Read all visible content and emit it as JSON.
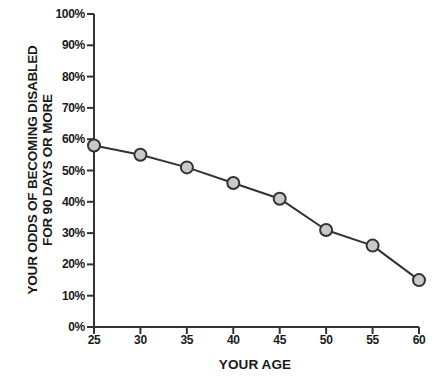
{
  "chart_data": {
    "type": "line",
    "title": "",
    "xlabel": "YOUR AGE",
    "ylabel": "YOUR ODDS OF BECOMING DISABLED FOR 90 DAYS OR MORE",
    "ylabel_lines": [
      "YOUR ODDS OF BECOMING DISABLED",
      "FOR 90 DAYS OR MORE"
    ],
    "x": [
      25,
      30,
      35,
      40,
      45,
      50,
      55,
      60
    ],
    "values": [
      58,
      55,
      51,
      46,
      41,
      31,
      26,
      15
    ],
    "categories": [
      "25",
      "30",
      "35",
      "40",
      "45",
      "50",
      "55",
      "60"
    ],
    "x_tick_labels": [
      "25",
      "30",
      "35",
      "40",
      "45",
      "50",
      "55",
      "60"
    ],
    "y_tick_labels": [
      "0%",
      "10%",
      "20%",
      "30%",
      "40%",
      "50%",
      "60%",
      "70%",
      "80%",
      "90%",
      "100%"
    ],
    "y_tick_values": [
      0,
      10,
      20,
      30,
      40,
      50,
      60,
      70,
      80,
      90,
      100
    ],
    "xlim": [
      25,
      60
    ],
    "ylim": [
      0,
      100
    ],
    "grid": false,
    "legend": false,
    "series": [
      {
        "name": "Odds of becoming disabled for 90 days or more",
        "values": [
          58,
          55,
          51,
          46,
          41,
          31,
          26,
          15
        ],
        "line_color": "#333333",
        "marker_fill": "#c9c9c9",
        "marker_edge": "#333333"
      }
    ],
    "colors": {
      "line": "#333333",
      "marker_fill": "#c9c9c9",
      "marker_edge": "#333333",
      "axis": "#333333",
      "text": "#1a1a1a",
      "background": "#ffffff"
    }
  }
}
